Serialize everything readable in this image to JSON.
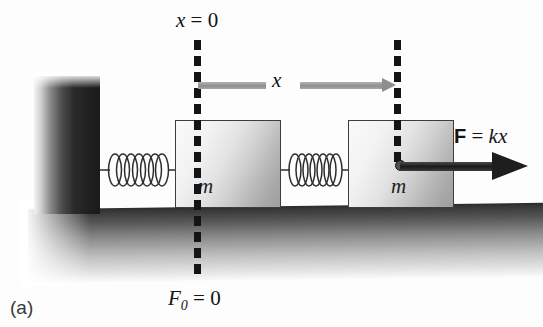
{
  "figure": {
    "caption": "(a)",
    "background_color": "#fdfdfd"
  },
  "labels": {
    "origin_line": {
      "var": "x",
      "eq": " = 0"
    },
    "zero_force": {
      "var": "F",
      "subscript": "0",
      "eq": " = 0"
    },
    "displacement": "x",
    "force": {
      "vector": "F",
      "eq": " = ",
      "expr": "kx"
    }
  },
  "blocks": [
    {
      "name": "block-equilibrium",
      "mass_label": "m",
      "x": 175,
      "y": 120,
      "width": 106,
      "height": 88
    },
    {
      "name": "block-displaced",
      "mass_label": "m",
      "x": 348,
      "y": 120,
      "width": 106,
      "height": 88
    }
  ],
  "springs": [
    {
      "name": "spring-relaxed",
      "coils": 7,
      "x": 100,
      "y": 148,
      "width": 76,
      "height": 42
    },
    {
      "name": "spring-stretched",
      "coils": 7,
      "x": 281,
      "y": 148,
      "width": 68,
      "height": 42
    }
  ],
  "reference_lines": [
    {
      "name": "dashline-origin",
      "x": 194,
      "top": 40,
      "bottom": 282,
      "dashes": 16
    },
    {
      "name": "dashline-displaced",
      "x": 394,
      "top": 40,
      "bottom": 168,
      "dashes": 8
    }
  ],
  "displacement_arrow": {
    "from_x": 198,
    "to_x": 397,
    "y": 82,
    "color": "#8e8e8e",
    "label_gap": [
      268,
      300
    ]
  },
  "force_arrow": {
    "from_x": 400,
    "to_x": 528,
    "y": 166,
    "color": "#1e1e1e"
  },
  "colors": {
    "wall_dark": "#1a1a1a",
    "ground_dark": "#2b2b2b",
    "block_outline": "#3d3d3d",
    "spring_stroke": "#2d2d2d",
    "dash_color": "#141414",
    "gray_arrow": "#8e8e8e",
    "force_arrow": "#1e1e1e",
    "text": "#141414"
  }
}
